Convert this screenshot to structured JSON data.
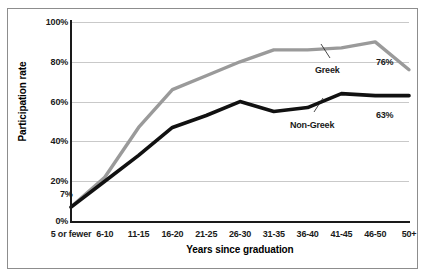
{
  "chart_data": {
    "type": "line",
    "title": "",
    "subtitle": "",
    "xlabel": "Years since graduation",
    "ylabel": "Participation rate",
    "categories": [
      "5 or fewer",
      "6-10",
      "11-15",
      "16-20",
      "21-25",
      "26-30",
      "31-35",
      "36-40",
      "41-45",
      "46-50",
      "50+"
    ],
    "ylim": [
      0,
      100
    ],
    "yticks": [
      "0%",
      "20%",
      "40%",
      "60%",
      "80%",
      "100%"
    ],
    "ytick_values": [
      0,
      20,
      40,
      60,
      80,
      100
    ],
    "grid": true,
    "legend_position": "inline-annotations",
    "series": [
      {
        "name": "Greek",
        "color": "#9a9a9a",
        "values": [
          7,
          22,
          47,
          66,
          73,
          80,
          86,
          86,
          87,
          90,
          76
        ]
      },
      {
        "name": "Non-Greek",
        "color": "#111111",
        "values": [
          7,
          20,
          33,
          47,
          53,
          60,
          55,
          57,
          64,
          63,
          63
        ]
      }
    ],
    "annotations": [
      {
        "text": "7%",
        "series": "both",
        "category": "5 or fewer"
      },
      {
        "text": "76%",
        "series": "Greek",
        "category": "50+"
      },
      {
        "text": "63%",
        "series": "Non-Greek",
        "category": "50+"
      },
      {
        "text": "Greek",
        "series": "Greek",
        "category": "41-45"
      },
      {
        "text": "Non-Greek",
        "series": "Non-Greek",
        "category": "41-45"
      }
    ]
  },
  "axes": {
    "y_title": "Participation rate",
    "x_title": "Years since graduation"
  },
  "labels": {
    "start_value": "7%",
    "greek_end_value": "76%",
    "nongreek_end_value": "63%",
    "greek_series_label": "Greek",
    "nongreek_series_label": "Non-Greek"
  },
  "colors": {
    "greek_line": "#9a9a9a",
    "nongreek_line": "#111111",
    "gridline": "#c9c9c9",
    "axis": "#1a1a1a",
    "frame": "#8d8d8d",
    "background": "#ffffff"
  }
}
